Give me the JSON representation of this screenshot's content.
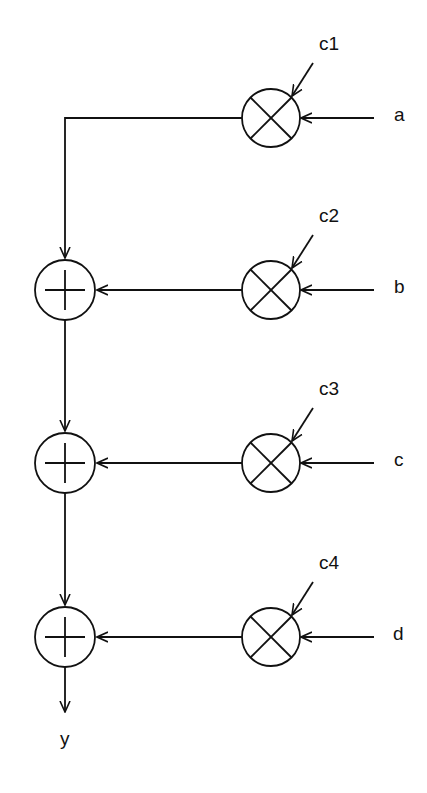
{
  "diagram": {
    "coefficients": [
      "c1",
      "c2",
      "c3",
      "c4"
    ],
    "inputs": [
      "a",
      "b",
      "c",
      "d"
    ],
    "output": "y",
    "multiplier_symbol": "multiply-icon",
    "adder_symbol": "add-icon",
    "stroke_color": "#111111",
    "background": "#ffffff"
  }
}
